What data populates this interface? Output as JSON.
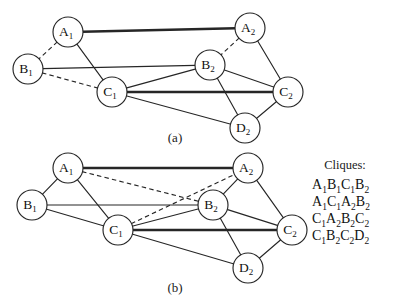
{
  "figure": {
    "background_color": "#ffffff",
    "stroke_color": "#262626",
    "node_fill": "#ffffff",
    "panels": [
      {
        "id": "a",
        "caption": "(a)",
        "caption_x": 175,
        "caption_y": 142,
        "nodes": [
          {
            "id": "A1",
            "base": "A",
            "sub": "1",
            "x": 68,
            "y": 32
          },
          {
            "id": "A2",
            "base": "A",
            "sub": "2",
            "x": 250,
            "y": 28
          },
          {
            "id": "B1",
            "base": "B",
            "sub": "1",
            "x": 28,
            "y": 69
          },
          {
            "id": "B2",
            "base": "B",
            "sub": "2",
            "x": 210,
            "y": 65
          },
          {
            "id": "C1",
            "base": "C",
            "sub": "1",
            "x": 112,
            "y": 92
          },
          {
            "id": "C2",
            "base": "C",
            "sub": "2",
            "x": 288,
            "y": 92
          },
          {
            "id": "D2",
            "base": "D",
            "sub": "2",
            "x": 245,
            "y": 128
          }
        ],
        "edges": [
          {
            "from": "A1",
            "to": "A2",
            "style": "thick"
          },
          {
            "from": "A1",
            "to": "B1",
            "style": "dashed"
          },
          {
            "from": "A1",
            "to": "C1",
            "style": "solid"
          },
          {
            "from": "B1",
            "to": "C1",
            "style": "dashed"
          },
          {
            "from": "B1",
            "to": "B2",
            "style": "solid"
          },
          {
            "from": "A2",
            "to": "B2",
            "style": "dashed"
          },
          {
            "from": "A2",
            "to": "C2",
            "style": "solid"
          },
          {
            "from": "B2",
            "to": "C1",
            "style": "solid"
          },
          {
            "from": "B2",
            "to": "C2",
            "style": "solid"
          },
          {
            "from": "B2",
            "to": "D2",
            "style": "solid"
          },
          {
            "from": "C1",
            "to": "C2",
            "style": "thick"
          },
          {
            "from": "C1",
            "to": "D2",
            "style": "solid"
          },
          {
            "from": "C2",
            "to": "D2",
            "style": "solid"
          }
        ]
      },
      {
        "id": "b",
        "caption": "(b)",
        "caption_x": 175,
        "caption_y": 292,
        "nodes": [
          {
            "id": "A1",
            "base": "A",
            "sub": "1",
            "x": 68,
            "y": 168
          },
          {
            "id": "A2",
            "base": "A",
            "sub": "2",
            "x": 248,
            "y": 168
          },
          {
            "id": "B1",
            "base": "B",
            "sub": "1",
            "x": 32,
            "y": 205
          },
          {
            "id": "B2",
            "base": "B",
            "sub": "2",
            "x": 213,
            "y": 205
          },
          {
            "id": "C1",
            "base": "C",
            "sub": "1",
            "x": 118,
            "y": 230
          },
          {
            "id": "C2",
            "base": "C",
            "sub": "2",
            "x": 292,
            "y": 230
          },
          {
            "id": "D2",
            "base": "D",
            "sub": "2",
            "x": 248,
            "y": 268
          }
        ],
        "edges": [
          {
            "from": "A1",
            "to": "A2",
            "style": "thick"
          },
          {
            "from": "A1",
            "to": "B1",
            "style": "solid"
          },
          {
            "from": "A1",
            "to": "C1",
            "style": "solid"
          },
          {
            "from": "A1",
            "to": "B2",
            "style": "dashed"
          },
          {
            "from": "B1",
            "to": "C1",
            "style": "solid"
          },
          {
            "from": "B1",
            "to": "B2",
            "style": "solid"
          },
          {
            "from": "C1",
            "to": "A2",
            "style": "dashed"
          },
          {
            "from": "A2",
            "to": "B2",
            "style": "solid"
          },
          {
            "from": "A2",
            "to": "C2",
            "style": "solid"
          },
          {
            "from": "B2",
            "to": "C1",
            "style": "solid"
          },
          {
            "from": "B2",
            "to": "C2",
            "style": "solid"
          },
          {
            "from": "B2",
            "to": "D2",
            "style": "solid"
          },
          {
            "from": "C1",
            "to": "C2",
            "style": "thick"
          },
          {
            "from": "C1",
            "to": "D2",
            "style": "solid"
          },
          {
            "from": "C2",
            "to": "D2",
            "style": "solid"
          }
        ]
      }
    ],
    "node_radius": 15
  },
  "cliques": {
    "title": "Cliques:",
    "title_x": 345,
    "title_y": 169,
    "list_x": 312,
    "list_start_y": 189,
    "line_height": 17,
    "items": [
      [
        {
          "base": "A",
          "sub": "1"
        },
        {
          "base": "B",
          "sub": "1"
        },
        {
          "base": "C",
          "sub": "1"
        },
        {
          "base": "B",
          "sub": "2"
        }
      ],
      [
        {
          "base": "A",
          "sub": "1"
        },
        {
          "base": "C",
          "sub": "1"
        },
        {
          "base": "A",
          "sub": "2"
        },
        {
          "base": "B",
          "sub": "2"
        }
      ],
      [
        {
          "base": "C",
          "sub": "1"
        },
        {
          "base": "A",
          "sub": "2"
        },
        {
          "base": "B",
          "sub": "2"
        },
        {
          "base": "C",
          "sub": "2"
        }
      ],
      [
        {
          "base": "C",
          "sub": "1"
        },
        {
          "base": "B",
          "sub": "2"
        },
        {
          "base": "C",
          "sub": "2"
        },
        {
          "base": "D",
          "sub": "2"
        }
      ]
    ]
  }
}
